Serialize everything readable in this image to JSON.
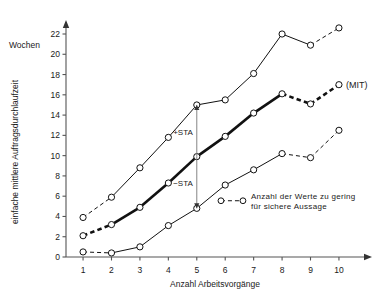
{
  "chart_data": {
    "type": "line",
    "title": "",
    "xlabel": "Anzahl Arbeitsvorgänge",
    "ylabel": "einfache mittlere Auftragsdurchlaufzeit",
    "yunit": "Wochen",
    "xlim": [
      0.4,
      10.6
    ],
    "ylim": [
      0,
      23
    ],
    "xticks": [
      1,
      2,
      3,
      4,
      5,
      6,
      7,
      8,
      9,
      10
    ],
    "xticklabels": [
      "1",
      "2",
      "3",
      "4",
      "5",
      "6",
      "7",
      "8",
      "9",
      "10"
    ],
    "yticks": [
      0,
      2,
      4,
      6,
      8,
      10,
      12,
      14,
      16,
      18,
      20,
      22
    ],
    "yticklabels": [
      "0",
      "2",
      "4",
      "6",
      "8",
      "10",
      "12",
      "14",
      "16",
      "18",
      "20",
      "22"
    ],
    "grid": false,
    "legend_position": "inside-lower-right",
    "x": [
      1,
      2,
      3,
      4,
      5,
      6,
      7,
      8,
      9,
      10
    ],
    "series": [
      {
        "name": "+STA",
        "style": "thin",
        "values": [
          3.9,
          5.9,
          8.8,
          11.8,
          15.0,
          15.5,
          18.1,
          22.0,
          20.9,
          22.6
        ],
        "uncertain_segments": [
          [
            1,
            2
          ],
          [
            9,
            10
          ]
        ]
      },
      {
        "name": "MIT",
        "style": "bold",
        "values": [
          2.1,
          3.2,
          4.9,
          7.3,
          9.9,
          11.9,
          14.2,
          16.1,
          15.1,
          17.0
        ],
        "uncertain_segments": [
          [
            1,
            2
          ],
          [
            8,
            9
          ],
          [
            9,
            10
          ]
        ],
        "label": "(MIT)"
      },
      {
        "name": "-STA",
        "style": "thin",
        "values": [
          0.5,
          0.4,
          1.0,
          3.1,
          4.8,
          7.1,
          8.6,
          10.2,
          9.8,
          12.5
        ],
        "uncertain_segments": [
          [
            1,
            2
          ],
          [
            8,
            9
          ],
          [
            9,
            10
          ]
        ]
      }
    ],
    "annotations": [
      {
        "name": "plus-sta",
        "text": "+STA",
        "x": 5,
        "y_from": 9.9,
        "y_to": 15.0
      },
      {
        "name": "minus-sta",
        "text": "−STA",
        "x": 5,
        "y_from": 9.9,
        "y_to": 4.8
      }
    ],
    "legend": {
      "line1": "Anzahl der Werte zu gering",
      "line2": "für sichere Aussage"
    }
  }
}
